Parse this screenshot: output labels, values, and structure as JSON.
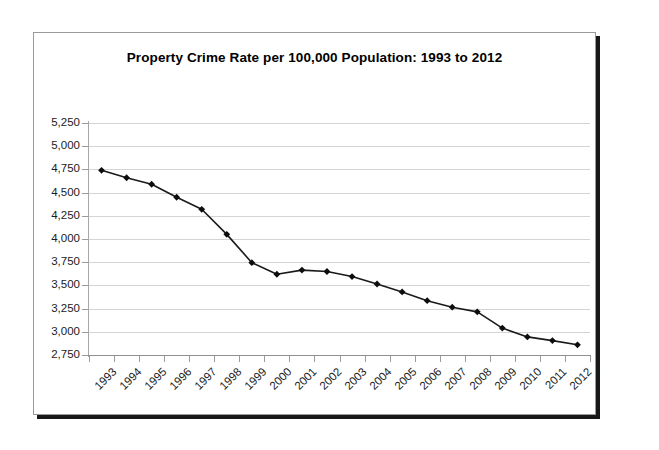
{
  "chart_data": {
    "type": "line",
    "title": "Property Crime Rate per 100,000 Population: 1993 to 2012",
    "xlabel": "",
    "ylabel": "",
    "categories": [
      "1993",
      "1994",
      "1995",
      "1996",
      "1997",
      "1998",
      "1999",
      "2000",
      "2001",
      "2002",
      "2003",
      "2004",
      "2005",
      "2006",
      "2007",
      "2008",
      "2009",
      "2010",
      "2011",
      "2012"
    ],
    "values": [
      4740,
      4660,
      4590,
      4450,
      4320,
      4050,
      3745,
      3620,
      3665,
      3650,
      3595,
      3515,
      3430,
      3335,
      3265,
      3215,
      3040,
      2945,
      2905,
      2860
    ],
    "series": [
      {
        "name": "Property Crime Rate",
        "values": [
          4740,
          4660,
          4590,
          4450,
          4320,
          4050,
          3745,
          3620,
          3665,
          3650,
          3595,
          3515,
          3430,
          3335,
          3265,
          3215,
          3040,
          2945,
          2905,
          2860
        ]
      }
    ],
    "ylim": [
      2750,
      5250
    ],
    "yticks": [
      2750,
      3000,
      3250,
      3500,
      3750,
      4000,
      4250,
      4500,
      4750,
      5000,
      5250
    ],
    "ytick_labels": [
      "2,750",
      "3,000",
      "3,250",
      "3,500",
      "3,750",
      "4,000",
      "4,250",
      "4,500",
      "4,750",
      "5,000",
      "5,250"
    ],
    "grid": true,
    "grid_axis": "y",
    "legend": false,
    "legend_position": "none",
    "marker": "diamond",
    "line_color": "#1a1a1a",
    "marker_color": "#0d0d0d",
    "grid_color": "#d4d4d4",
    "background_color": "#ffffff",
    "xtick_rotation": -45
  },
  "frame": {
    "border_color": "#9a9a9a",
    "shadow_color": "#17181a"
  }
}
